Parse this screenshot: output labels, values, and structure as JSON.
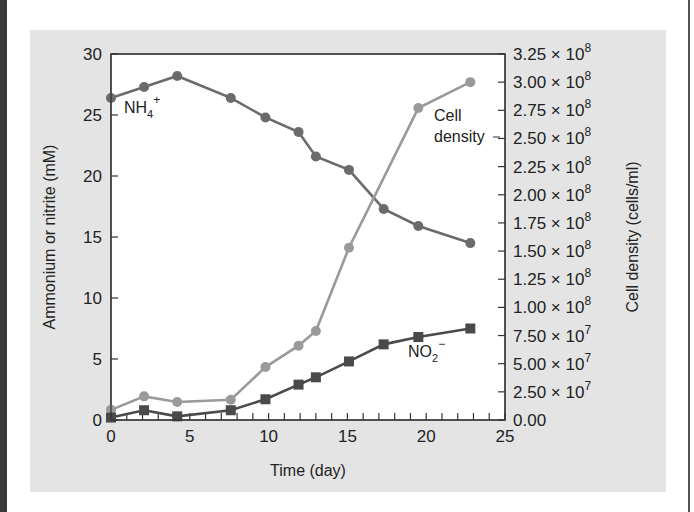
{
  "chart_data": {
    "type": "line",
    "title": "",
    "xlabel": "Time (day)",
    "ylabel": "Ammonium or nitrite (mM)",
    "y2label": "Cell density (cells/ml)",
    "xlim": [
      0,
      25
    ],
    "ylim": [
      0,
      30
    ],
    "y2lim": [
      0,
      325000000
    ],
    "grid": false,
    "legend": "inline annotations",
    "x_ticks": [
      "0",
      "5",
      "10",
      "15",
      "20",
      "25"
    ],
    "y_ticks": [
      "0",
      "5",
      "10",
      "15",
      "20",
      "25",
      "30"
    ],
    "y2_ticks": [
      "0.00",
      "2.50 × 10^7",
      "5.00 × 10^7",
      "7.50 × 10^7",
      "1.00 × 10^8",
      "1.25 × 10^8",
      "1.50 × 10^8",
      "1.75 × 10^8",
      "2.00 × 10^8",
      "2.25 × 10^8",
      "2.50 × 10^8",
      "2.75 × 10^8",
      "3.00 × 10^8",
      "3.25 × 10^8"
    ],
    "series": [
      {
        "name": "NH4+",
        "axis": "left",
        "marker": "circle",
        "color": "#6b6b6b",
        "x": [
          0,
          2.1,
          4.2,
          7.6,
          9.8,
          11.9,
          13.0,
          15.1,
          17.3,
          19.5,
          22.8
        ],
        "y": [
          26.4,
          27.3,
          28.2,
          26.4,
          24.8,
          23.6,
          21.6,
          20.5,
          17.3,
          15.9,
          14.5
        ]
      },
      {
        "name": "Cell density",
        "axis": "right",
        "marker": "circle",
        "color": "#9a9a9a",
        "x": [
          0,
          2.1,
          4.2,
          7.6,
          9.8,
          11.9,
          13.0,
          15.1,
          19.5,
          22.8
        ],
        "y": [
          9000000,
          21000000,
          16000000,
          18000000,
          47000000,
          66000000,
          79000000,
          153000000,
          277000000,
          300000000
        ]
      },
      {
        "name": "NO2-",
        "axis": "left",
        "marker": "square",
        "color": "#4a4a4a",
        "x": [
          0,
          2.1,
          4.2,
          7.6,
          9.8,
          11.9,
          13.0,
          15.1,
          17.3,
          19.5,
          22.8
        ],
        "y": [
          0.2,
          0.8,
          0.3,
          0.8,
          1.7,
          2.9,
          3.5,
          4.8,
          6.2,
          6.8,
          7.5
        ]
      }
    ],
    "annotations": {
      "nh4": {
        "base": "NH",
        "sub": "4",
        "sup": "+"
      },
      "cell_density_line1": "Cell",
      "cell_density_line2": "density",
      "no2": {
        "base": "NO",
        "sub": "2",
        "sup": "−"
      }
    }
  }
}
